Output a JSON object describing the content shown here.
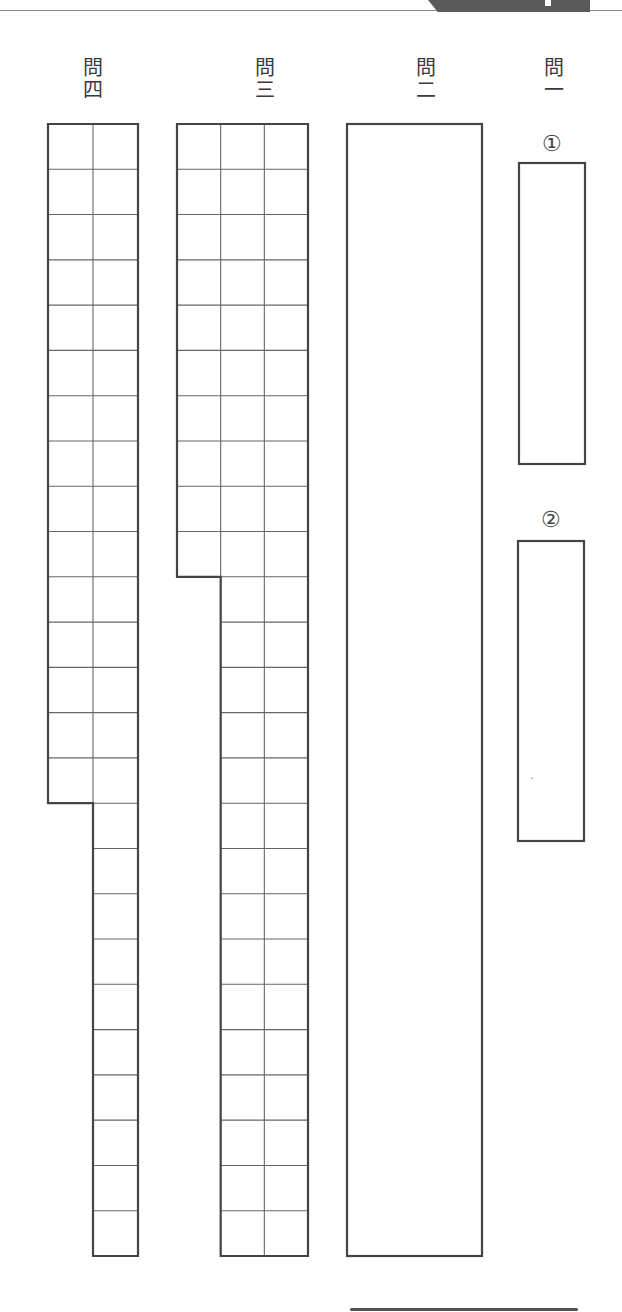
{
  "sheet": {
    "layout": {
      "cell_height": 45.25,
      "top_y": 124,
      "bottom_y": 1256,
      "line_color": "#444444",
      "grid_line_color": "#666666"
    },
    "questions": [
      {
        "id": "q4",
        "label_main": "問",
        "label_num": "四",
        "type": "grid",
        "columns": 2,
        "rows_total": 25,
        "short_column_rows": 15,
        "answer_cells_total": 40
      },
      {
        "id": "q3",
        "label_main": "問",
        "label_num": "三",
        "type": "grid",
        "columns": 3,
        "rows_total": 25,
        "short_column_rows": 10,
        "answer_cells_total": 60
      },
      {
        "id": "q2",
        "label_main": "問",
        "label_num": "二",
        "type": "box"
      },
      {
        "id": "q1",
        "label_main": "問",
        "label_num": "一",
        "type": "sub-boxes",
        "sub_items": [
          {
            "label": "①"
          },
          {
            "label": "②"
          }
        ]
      }
    ]
  }
}
